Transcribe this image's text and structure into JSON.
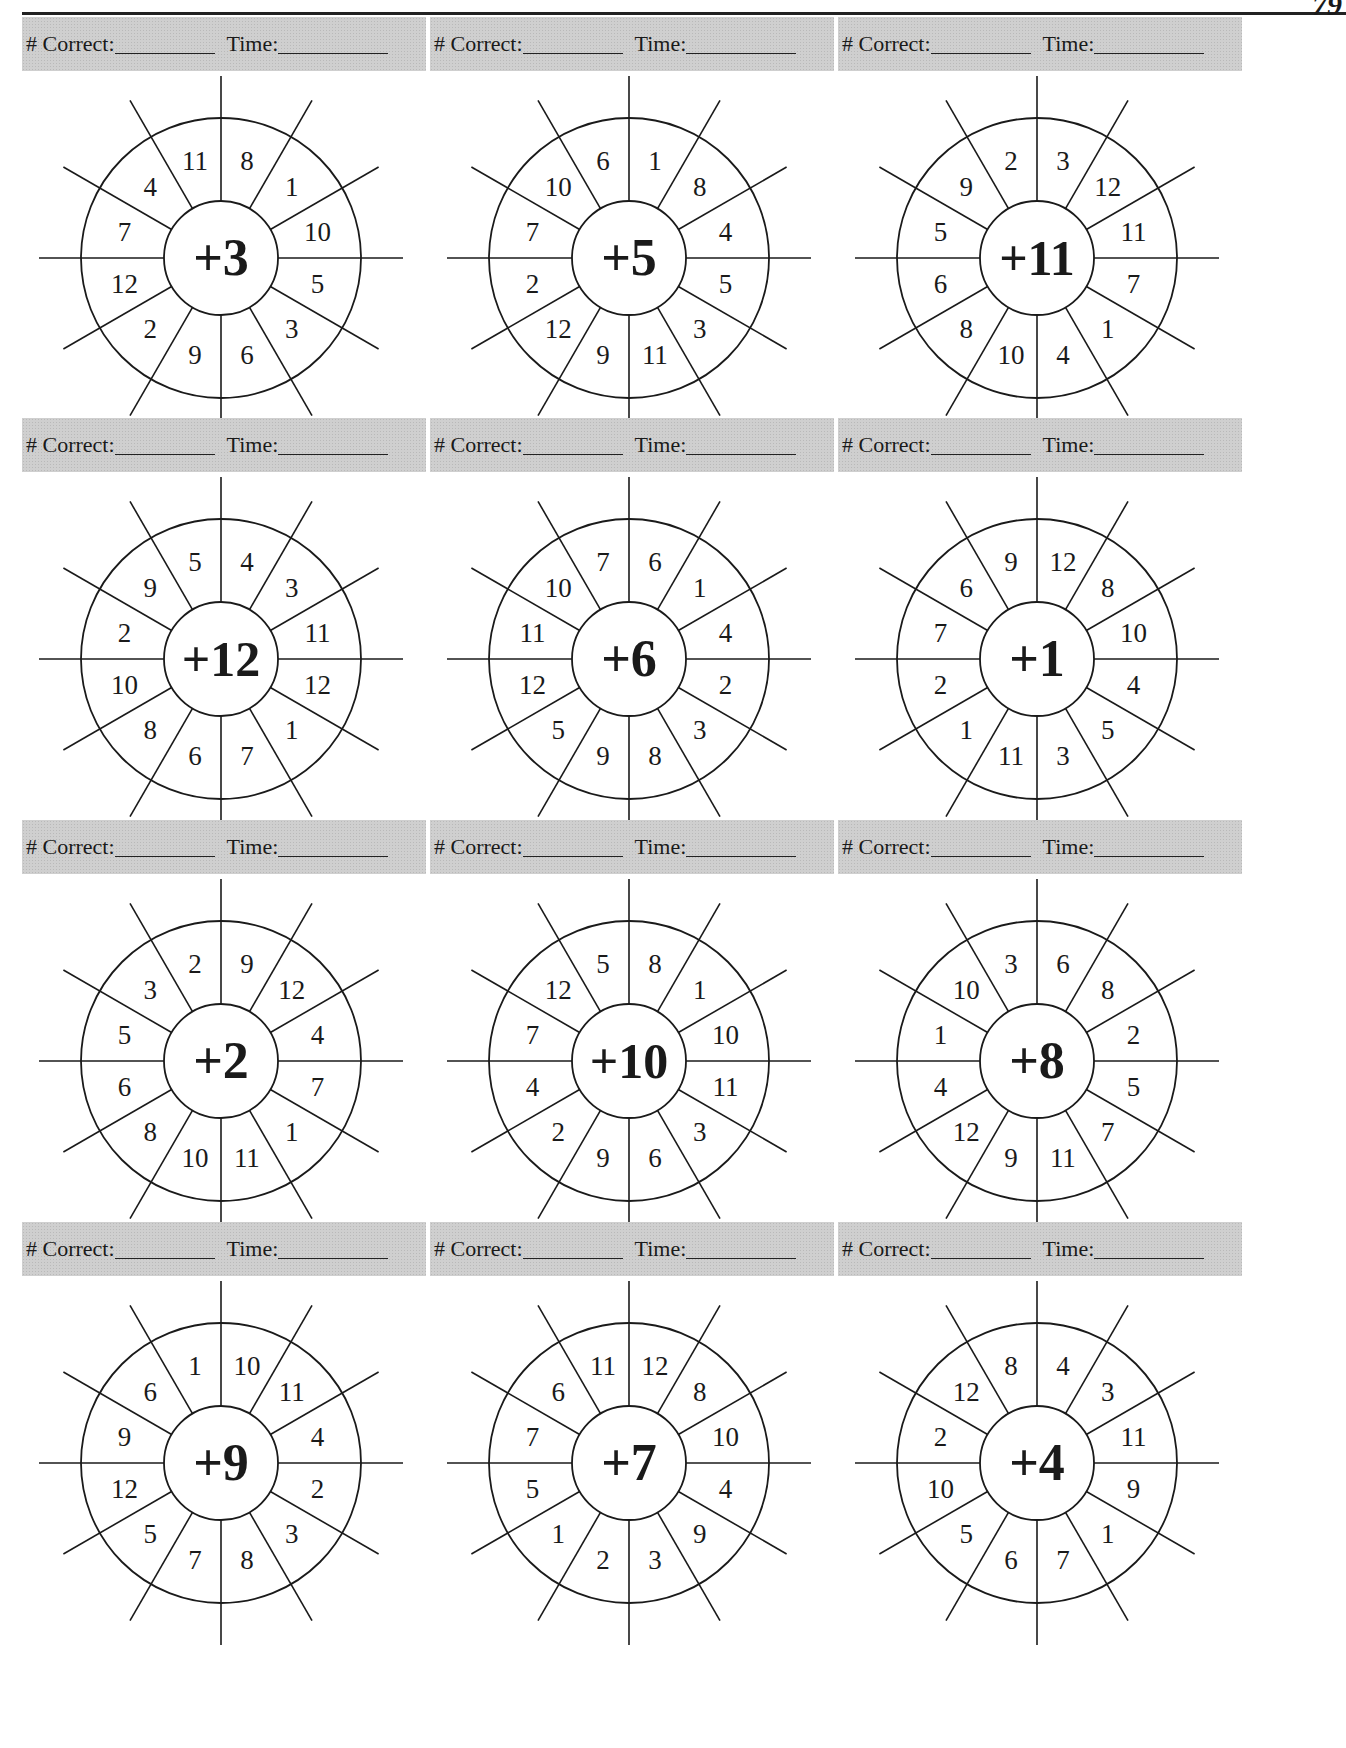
{
  "page": {
    "page_number": "79",
    "score_labels": {
      "correct": "# Correct:",
      "time": "Time:"
    }
  },
  "wheels": [
    {
      "addend": "+3",
      "numbers": [
        "8",
        "1",
        "10",
        "5",
        "3",
        "6",
        "9",
        "2",
        "12",
        "7",
        "4",
        "11"
      ]
    },
    {
      "addend": "+5",
      "numbers": [
        "1",
        "8",
        "4",
        "5",
        "3",
        "11",
        "9",
        "12",
        "2",
        "7",
        "10",
        "6"
      ]
    },
    {
      "addend": "+11",
      "numbers": [
        "3",
        "12",
        "11",
        "7",
        "1",
        "4",
        "10",
        "8",
        "6",
        "5",
        "9",
        "2"
      ]
    },
    {
      "addend": "+12",
      "numbers": [
        "4",
        "3",
        "11",
        "12",
        "1",
        "7",
        "6",
        "8",
        "10",
        "2",
        "9",
        "5"
      ]
    },
    {
      "addend": "+6",
      "numbers": [
        "6",
        "1",
        "4",
        "2",
        "3",
        "8",
        "9",
        "5",
        "12",
        "11",
        "10",
        "7"
      ]
    },
    {
      "addend": "+1",
      "numbers": [
        "12",
        "8",
        "10",
        "4",
        "5",
        "3",
        "11",
        "1",
        "2",
        "7",
        "6",
        "9"
      ]
    },
    {
      "addend": "+2",
      "numbers": [
        "9",
        "12",
        "4",
        "7",
        "1",
        "11",
        "10",
        "8",
        "6",
        "5",
        "3",
        "2"
      ]
    },
    {
      "addend": "+10",
      "numbers": [
        "8",
        "1",
        "10",
        "11",
        "3",
        "6",
        "9",
        "2",
        "4",
        "7",
        "12",
        "5"
      ]
    },
    {
      "addend": "+8",
      "numbers": [
        "6",
        "8",
        "2",
        "5",
        "7",
        "11",
        "9",
        "12",
        "4",
        "1",
        "10",
        "3"
      ]
    },
    {
      "addend": "+9",
      "numbers": [
        "10",
        "11",
        "4",
        "2",
        "3",
        "8",
        "7",
        "5",
        "12",
        "9",
        "6",
        "1"
      ]
    },
    {
      "addend": "+7",
      "numbers": [
        "12",
        "8",
        "10",
        "4",
        "9",
        "3",
        "2",
        "1",
        "5",
        "7",
        "6",
        "11"
      ]
    },
    {
      "addend": "+4",
      "numbers": [
        "4",
        "3",
        "11",
        "9",
        "1",
        "7",
        "6",
        "5",
        "10",
        "2",
        "12",
        "8"
      ]
    }
  ]
}
